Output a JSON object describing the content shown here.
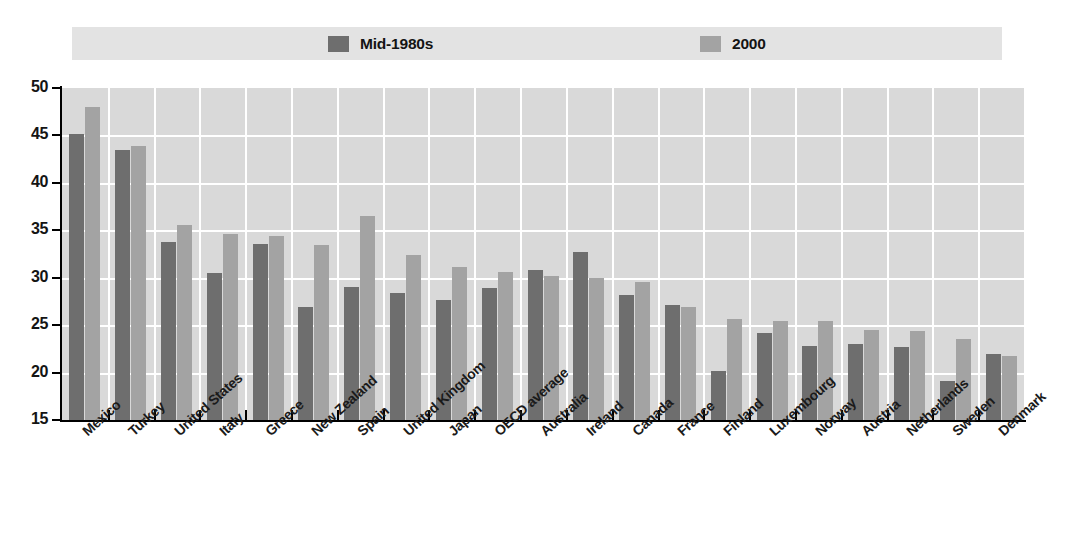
{
  "legend": {
    "entries": [
      {
        "label": "Mid-1980s",
        "color": "#6e6e6e"
      },
      {
        "label": "2000",
        "color": "#a3a3a3"
      }
    ]
  },
  "axes": {
    "y_ticks": [
      "50",
      "45",
      "40",
      "35",
      "30",
      "25",
      "20",
      "15"
    ],
    "y_min": 15,
    "y_max": 50
  },
  "chart_data": {
    "type": "bar",
    "title": "",
    "subtitle": "",
    "xlabel": "",
    "ylabel": "",
    "ylim": [
      15,
      50
    ],
    "grid": true,
    "legend_position": "top",
    "categories": [
      "Mexico",
      "Turkey",
      "United States",
      "Italy",
      "Greece",
      "New Zealand",
      "Spain",
      "United Kingdom",
      "Japan",
      "OECD average",
      "Australia",
      "Ireland",
      "Canada",
      "France",
      "Finland",
      "Luxembourg",
      "Norway",
      "Austria",
      "Netherlands",
      "Sweden",
      "Denmark"
    ],
    "emphasized_category": "OECD average",
    "series": [
      {
        "name": "Mid-1980s",
        "color": "#6e6e6e",
        "values": [
          45.2,
          43.5,
          33.8,
          30.5,
          33.6,
          26.9,
          29.0,
          28.4,
          27.6,
          28.9,
          30.8,
          32.7,
          28.2,
          27.1,
          20.2,
          24.2,
          22.8,
          23.0,
          22.7,
          19.1,
          22.0
        ]
      },
      {
        "name": "2000",
        "color": "#a3a3a3",
        "values": [
          48.0,
          43.9,
          35.6,
          34.6,
          34.4,
          33.5,
          36.5,
          32.4,
          31.1,
          30.6,
          30.2,
          30.0,
          29.6,
          26.9,
          25.6,
          25.4,
          25.4,
          24.5,
          24.4,
          23.5,
          21.7
        ]
      }
    ]
  }
}
